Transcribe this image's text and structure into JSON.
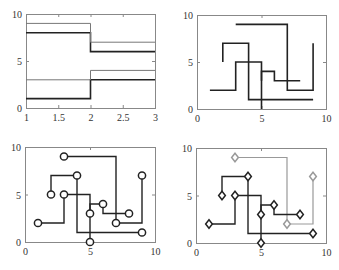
{
  "figure": {
    "width": 339,
    "height": 270,
    "background": "#ffffff",
    "axis_color": "#888888",
    "tick_label_color": "#333333"
  },
  "chart_data": [
    {
      "type": "line",
      "subtype": "stairs",
      "name": "subplot-1",
      "box": {
        "left": 26,
        "top": 14,
        "right": 155,
        "bottom": 108
      },
      "xlim": [
        1,
        3
      ],
      "ylim": [
        0,
        10
      ],
      "xticks": [
        1,
        1.5,
        2,
        2.5,
        3
      ],
      "xtick_labels": [
        "1",
        "1.5",
        "2",
        "2.5",
        "3"
      ],
      "yticks": [
        0,
        5,
        10
      ],
      "ytick_labels": [
        "0",
        "5",
        "10"
      ],
      "grid": false,
      "series": [
        {
          "name": "series-1",
          "color": "#222222",
          "width": 1.6,
          "path": [
            [
              1,
              8
            ],
            [
              2,
              8
            ],
            [
              2,
              6
            ],
            [
              3,
              6
            ]
          ]
        },
        {
          "name": "series-2",
          "color": "#222222",
          "width": 1.6,
          "path": [
            [
              1,
              1
            ],
            [
              2,
              1
            ],
            [
              2,
              3
            ],
            [
              3,
              3
            ]
          ]
        },
        {
          "name": "series-3",
          "color": "#777777",
          "width": 1.0,
          "path": [
            [
              1,
              9
            ],
            [
              2,
              9
            ],
            [
              2,
              7
            ],
            [
              3,
              7
            ]
          ]
        },
        {
          "name": "series-4",
          "color": "#777777",
          "width": 1.0,
          "path": [
            [
              1,
              3
            ],
            [
              2,
              3
            ],
            [
              2,
              4
            ],
            [
              3,
              4
            ]
          ]
        }
      ]
    },
    {
      "type": "line",
      "subtype": "stairs",
      "name": "subplot-2",
      "box": {
        "left": 197,
        "top": 15,
        "right": 326,
        "bottom": 109
      },
      "xlim": [
        0,
        10
      ],
      "ylim": [
        0,
        10
      ],
      "xticks": [
        0,
        5,
        10
      ],
      "xtick_labels": [
        "0",
        "5",
        "10"
      ],
      "yticks": [
        0,
        5,
        10
      ],
      "ytick_labels": [
        "0",
        "5",
        "10"
      ],
      "grid": false,
      "series": [
        {
          "name": "series-a",
          "color": "#222222",
          "width": 1.6,
          "path": [
            [
              3,
              9
            ],
            [
              7,
              9
            ],
            [
              7,
              2
            ],
            [
              9,
              2
            ],
            [
              9,
              7
            ]
          ]
        },
        {
          "name": "series-b",
          "color": "#222222",
          "width": 1.6,
          "path": [
            [
              2,
              5
            ],
            [
              2,
              7
            ],
            [
              4,
              7
            ],
            [
              4,
              1
            ],
            [
              9,
              1
            ]
          ]
        },
        {
          "name": "series-c",
          "color": "#222222",
          "width": 1.6,
          "path": [
            [
              1,
              2
            ],
            [
              3,
              2
            ],
            [
              3,
              5
            ],
            [
              5,
              5
            ],
            [
              5,
              0
            ]
          ]
        },
        {
          "name": "series-d",
          "color": "#222222",
          "width": 1.6,
          "path": [
            [
              5,
              3
            ],
            [
              5,
              4
            ],
            [
              6,
              4
            ],
            [
              6,
              3
            ],
            [
              8,
              3
            ]
          ]
        }
      ]
    },
    {
      "type": "line",
      "subtype": "stairs-with-markers",
      "name": "subplot-3",
      "box": {
        "left": 25,
        "top": 147,
        "right": 155,
        "bottom": 242
      },
      "xlim": [
        0,
        10
      ],
      "ylim": [
        0,
        10
      ],
      "xticks": [
        0,
        5,
        10
      ],
      "xtick_labels": [
        "0",
        "5",
        "10"
      ],
      "yticks": [
        0,
        5,
        10
      ],
      "ytick_labels": [
        "0",
        "5",
        "10"
      ],
      "grid": false,
      "marker": "circle",
      "series": [
        {
          "name": "series-a",
          "color": "#222222",
          "width": 1.4,
          "path": [
            [
              3,
              9
            ],
            [
              7,
              9
            ],
            [
              7,
              2
            ],
            [
              9,
              2
            ],
            [
              9,
              7
            ]
          ],
          "points": [
            [
              3,
              9
            ],
            [
              7,
              2
            ],
            [
              9,
              7
            ]
          ]
        },
        {
          "name": "series-b",
          "color": "#222222",
          "width": 1.4,
          "path": [
            [
              2,
              5
            ],
            [
              2,
              7
            ],
            [
              4,
              7
            ],
            [
              4,
              1
            ],
            [
              9,
              1
            ]
          ],
          "points": [
            [
              2,
              5
            ],
            [
              4,
              7
            ],
            [
              9,
              1
            ]
          ]
        },
        {
          "name": "series-c",
          "color": "#222222",
          "width": 1.4,
          "path": [
            [
              1,
              2
            ],
            [
              3,
              2
            ],
            [
              3,
              5
            ],
            [
              5,
              5
            ],
            [
              5,
              0
            ]
          ],
          "points": [
            [
              1,
              2
            ],
            [
              3,
              5
            ],
            [
              5,
              0
            ]
          ]
        },
        {
          "name": "series-d",
          "color": "#222222",
          "width": 1.4,
          "path": [
            [
              5,
              3
            ],
            [
              5,
              4
            ],
            [
              6,
              4
            ],
            [
              6,
              3
            ],
            [
              8,
              3
            ]
          ],
          "points": [
            [
              5,
              3
            ],
            [
              6,
              4
            ],
            [
              8,
              3
            ]
          ]
        }
      ]
    },
    {
      "type": "line",
      "subtype": "stairs-with-markers",
      "name": "subplot-4",
      "box": {
        "left": 196,
        "top": 148,
        "right": 326,
        "bottom": 243
      },
      "xlim": [
        0,
        10
      ],
      "ylim": [
        0,
        10
      ],
      "xticks": [
        0,
        5,
        10
      ],
      "xtick_labels": [
        "0",
        "5",
        "10"
      ],
      "yticks": [
        0,
        5,
        10
      ],
      "ytick_labels": [
        "0",
        "5",
        "10"
      ],
      "grid": false,
      "marker": "diamond",
      "series": [
        {
          "name": "series-a",
          "color": "#999999",
          "width": 1.2,
          "path": [
            [
              3,
              9
            ],
            [
              7,
              9
            ],
            [
              7,
              2
            ],
            [
              9,
              2
            ],
            [
              9,
              7
            ]
          ],
          "points": [
            [
              3,
              9
            ],
            [
              7,
              2
            ],
            [
              9,
              7
            ]
          ]
        },
        {
          "name": "series-b",
          "color": "#222222",
          "width": 1.4,
          "path": [
            [
              2,
              5
            ],
            [
              2,
              7
            ],
            [
              4,
              7
            ],
            [
              4,
              1
            ],
            [
              9,
              1
            ]
          ],
          "points": [
            [
              2,
              5
            ],
            [
              4,
              7
            ],
            [
              9,
              1
            ]
          ]
        },
        {
          "name": "series-c",
          "color": "#222222",
          "width": 1.4,
          "path": [
            [
              1,
              2
            ],
            [
              3,
              2
            ],
            [
              3,
              5
            ],
            [
              5,
              5
            ],
            [
              5,
              0
            ]
          ],
          "points": [
            [
              1,
              2
            ],
            [
              3,
              5
            ],
            [
              5,
              0
            ]
          ]
        },
        {
          "name": "series-d",
          "color": "#222222",
          "width": 1.4,
          "path": [
            [
              5,
              3
            ],
            [
              5,
              4
            ],
            [
              6,
              4
            ],
            [
              6,
              3
            ],
            [
              8,
              3
            ]
          ],
          "points": [
            [
              5,
              3
            ],
            [
              6,
              4
            ],
            [
              8,
              3
            ]
          ]
        }
      ]
    }
  ]
}
